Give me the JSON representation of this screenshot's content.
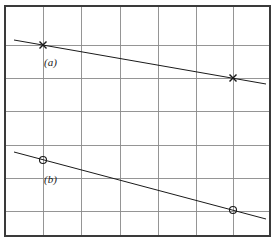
{
  "figure": {
    "background_color": "#ffffff",
    "frame": {
      "x0": 5,
      "y0": 6,
      "x1": 270,
      "y1": 236,
      "border_color": "#3a3a3a",
      "border_width": 1.6
    },
    "grid": {
      "color": "#8a8a8a",
      "width": 0.9,
      "x_lines": [
        5,
        43,
        81,
        120,
        158,
        196,
        233,
        270
      ],
      "y_lines": [
        6,
        45,
        78,
        111,
        145,
        178,
        211,
        236
      ],
      "columns": 7,
      "rows": 7
    },
    "labels": [
      {
        "name": "label-a",
        "text": "(a)",
        "x": 44,
        "y": 56
      },
      {
        "name": "label-b",
        "text": "(b)",
        "x": 44,
        "y": 173
      }
    ]
  },
  "chart_data": {
    "type": "line",
    "title": "",
    "xlabel": "",
    "ylabel": "",
    "grid": true,
    "legend": "none",
    "xlim": [
      0,
      7
    ],
    "ylim": [
      0,
      7
    ],
    "axis_note": "unlabeled grid; values given in pixel coordinates of the plot frame",
    "series": [
      {
        "name": "(a)",
        "label": "(a)",
        "marker": "x",
        "marker_size": 7,
        "color": "#1a1a1a",
        "line_width": 1.0,
        "points_px": [
          {
            "x": 43,
            "y": 45
          },
          {
            "x": 233,
            "y": 78
          }
        ],
        "segment_px": {
          "x_start": 14,
          "y_start": 40,
          "x_end": 266,
          "y_end": 84
        },
        "slope_px_per_px": 0.1737,
        "grid_points": [
          {
            "x": 1,
            "y": 6
          },
          {
            "x": 6,
            "y": 5
          }
        ]
      },
      {
        "name": "(b)",
        "label": "(b)",
        "marker": "o",
        "marker_size": 7,
        "color": "#1a1a1a",
        "line_width": 1.0,
        "points_px": [
          {
            "x": 43,
            "y": 160
          },
          {
            "x": 233,
            "y": 210
          }
        ],
        "segment_px": {
          "x_start": 14,
          "y_start": 152,
          "x_end": 266,
          "y_end": 219
        },
        "slope_px_per_px": 0.2632,
        "grid_points": [
          {
            "x": 1,
            "y": 2.55
          },
          {
            "x": 6,
            "y": 1.0
          }
        ]
      }
    ]
  }
}
